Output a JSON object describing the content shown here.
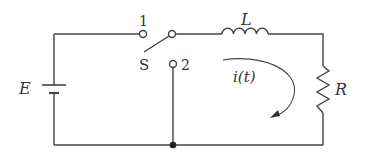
{
  "diagram": {
    "type": "RL circuit with SPDT switch",
    "components": {
      "source": {
        "label": "E",
        "type": "DC battery"
      },
      "switch": {
        "label": "S",
        "terminals": [
          "1",
          "2"
        ]
      },
      "inductor": {
        "label": "L"
      },
      "resistor": {
        "label": "R"
      },
      "current": {
        "label": "i(t)",
        "direction": "clockwise"
      }
    },
    "colors": {
      "wire": "#444444",
      "background": "#ffffff",
      "text": "#333333"
    }
  }
}
